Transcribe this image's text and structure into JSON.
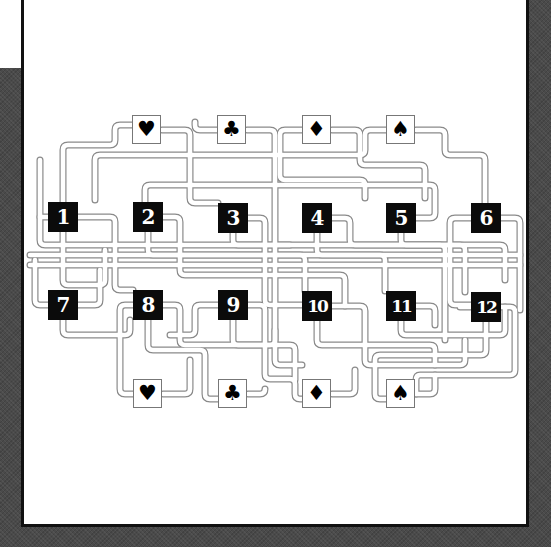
{
  "puzzle": {
    "type": "track-connection puzzle",
    "colors": {
      "tile_bg": "#0b0b0b",
      "tile_text": "#ffffff",
      "track_edge": "#8a8a8a",
      "panel_bg": "#ffffff",
      "backdrop": "#4a4a4a"
    },
    "top_suits": [
      {
        "symbol": "♥",
        "name": "heart",
        "x": 132,
        "y": 115
      },
      {
        "symbol": "♣",
        "name": "club",
        "x": 217,
        "y": 115
      },
      {
        "symbol": "♦",
        "name": "diamond",
        "x": 302,
        "y": 115
      },
      {
        "symbol": "♠",
        "name": "spade",
        "x": 386,
        "y": 115
      }
    ],
    "bottom_suits": [
      {
        "symbol": "♥",
        "name": "heart",
        "x": 133,
        "y": 379
      },
      {
        "symbol": "♣",
        "name": "club",
        "x": 218,
        "y": 379
      },
      {
        "symbol": "♦",
        "name": "diamond",
        "x": 302,
        "y": 379
      },
      {
        "symbol": "♠",
        "name": "spade",
        "x": 386,
        "y": 379
      }
    ],
    "tiles": [
      {
        "label": "1",
        "x": 48,
        "y": 202
      },
      {
        "label": "2",
        "x": 133,
        "y": 202
      },
      {
        "label": "3",
        "x": 218,
        "y": 203
      },
      {
        "label": "4",
        "x": 302,
        "y": 203
      },
      {
        "label": "5",
        "x": 386,
        "y": 203
      },
      {
        "label": "6",
        "x": 471,
        "y": 203
      },
      {
        "label": "7",
        "x": 48,
        "y": 290
      },
      {
        "label": "8",
        "x": 133,
        "y": 290
      },
      {
        "label": "9",
        "x": 218,
        "y": 290
      },
      {
        "label": "10",
        "x": 302,
        "y": 291
      },
      {
        "label": "11",
        "x": 386,
        "y": 291
      },
      {
        "label": "12",
        "x": 471,
        "y": 292
      }
    ]
  }
}
